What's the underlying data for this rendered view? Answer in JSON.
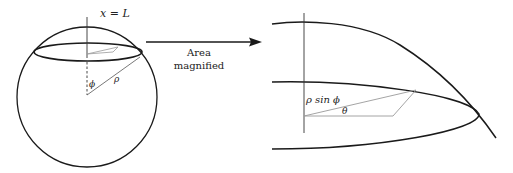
{
  "diagram": {
    "left_panel": {
      "label_top": "x = L",
      "angle_label": "ϕ",
      "radius_label": "ρ"
    },
    "arrow": {
      "line1": "Area",
      "line2": "magnified"
    },
    "right_panel": {
      "radius_label": "ρ sin ϕ",
      "angle_label": "θ"
    },
    "colors": {
      "stroke": "#1a1a1a",
      "thin_stroke": "#9a9a9a",
      "background": "#ffffff"
    }
  }
}
